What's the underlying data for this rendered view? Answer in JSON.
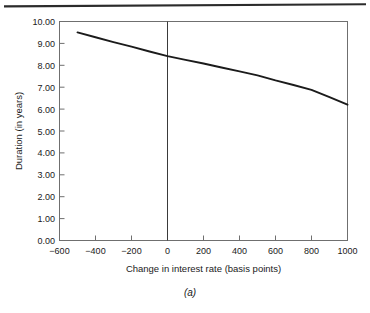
{
  "figure": {
    "caption": "(a)",
    "rule_color": "#2b2b2b",
    "frame_color": "#6f6f6f",
    "line_color": "#1b1b1b",
    "background": "#ffffff"
  },
  "chart_data": {
    "type": "line",
    "title": "",
    "subtitle": "",
    "xlabel": "Change in interest rate (basis points)",
    "ylabel": "Duration (in years)",
    "xlim": [
      -600,
      1000
    ],
    "ylim": [
      0.0,
      10.0
    ],
    "xticks": [
      -600,
      -400,
      -200,
      0,
      200,
      400,
      600,
      800,
      1000
    ],
    "xtick_labels": [
      "−600",
      "−400",
      "−200",
      "0",
      "200",
      "400",
      "600",
      "800",
      "1000"
    ],
    "yticks": [
      0,
      1,
      2,
      3,
      4,
      5,
      6,
      7,
      8,
      9,
      10
    ],
    "ytick_labels": [
      "0.00",
      "1.00",
      "2.00",
      "3.00",
      "4.00",
      "5.00",
      "6.00",
      "7.00",
      "8.00",
      "9.00",
      "10.00"
    ],
    "grid": false,
    "legend": null,
    "legend_position": "none",
    "annotations": [
      {
        "name": "zero-reference-line",
        "x": 0,
        "type": "vertical-line"
      }
    ],
    "series": [
      {
        "name": "Duration",
        "x": [
          -500,
          -400,
          -300,
          -200,
          -100,
          0,
          100,
          200,
          300,
          400,
          500,
          600,
          700,
          800,
          900,
          1000
        ],
        "values": [
          9.5,
          9.28,
          9.06,
          8.85,
          8.63,
          8.42,
          8.25,
          8.08,
          7.9,
          7.72,
          7.54,
          7.31,
          7.1,
          6.88,
          6.55,
          6.2
        ]
      }
    ]
  }
}
